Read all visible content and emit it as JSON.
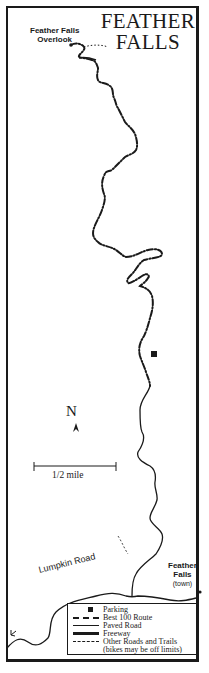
{
  "map": {
    "title_line1": "FEATHER",
    "title_line2": "FALLS",
    "labels": {
      "overlook_line1": "Feather Falls",
      "overlook_line2": "Overlook",
      "town_line1": "Feather",
      "town_line2": "Falls",
      "town_line3": "(town)",
      "road": "Lumpkin Road",
      "side_direction": "to Lake Oroville"
    },
    "north_label": "N",
    "scale_label": "1/2 mile",
    "colors": {
      "ink": "#1a1a1a",
      "background": "#ffffff"
    }
  },
  "legend": {
    "items": [
      {
        "symbol": "parking-square",
        "label": "Parking"
      },
      {
        "symbol": "dash-dot-line",
        "label": "Best 100 Route"
      },
      {
        "symbol": "thin-solid-line",
        "label": "Paved Road"
      },
      {
        "symbol": "thick-solid-line",
        "label": "Freeway"
      },
      {
        "symbol": "dashed-line",
        "label": "Other Roads and Trails"
      }
    ],
    "note": "(bikes may be off limits)"
  }
}
